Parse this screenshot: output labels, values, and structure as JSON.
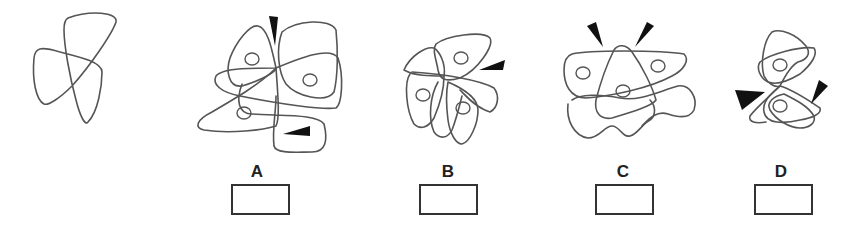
{
  "puzzle": {
    "reference_figure": "single outline shape (target)",
    "options": [
      {
        "label": "A",
        "arrows": 2,
        "nuclei": 3
      },
      {
        "label": "B",
        "arrows": 1,
        "nuclei": 3
      },
      {
        "label": "C",
        "arrows": 2,
        "nuclei": 3
      },
      {
        "label": "D",
        "arrows": 2,
        "nuclei": 2
      }
    ],
    "answer_boxes": [
      "",
      "",
      "",
      ""
    ]
  },
  "colors": {
    "outline": "#555555",
    "arrow": "#111111",
    "box_border": "#333333"
  }
}
